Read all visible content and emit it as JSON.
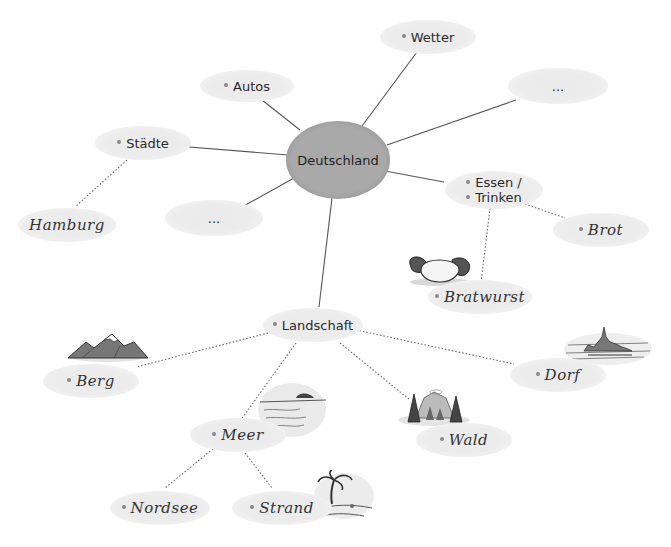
{
  "diagram": {
    "type": "mind-map",
    "center": {
      "label": "Deutschland",
      "color": "#a9a9a9"
    },
    "node_color": "#ececec",
    "nodes": {
      "wetter": {
        "label": "Wetter"
      },
      "autos": {
        "label": "Autos"
      },
      "blank_right": {
        "label": "..."
      },
      "staedte": {
        "label": "Städte"
      },
      "hamburg": {
        "label": "Hamburg"
      },
      "blank_left": {
        "label": "..."
      },
      "essen": {
        "line1": "Essen /",
        "line2": "Trinken"
      },
      "brot": {
        "label": "Brot"
      },
      "bratwurst": {
        "label": "Bratwurst"
      },
      "landschaft": {
        "label": "Landschaft"
      },
      "berg": {
        "label": "Berg"
      },
      "dorf": {
        "label": "Dorf"
      },
      "wald": {
        "label": "Wald"
      },
      "meer": {
        "label": "Meer"
      },
      "nordsee": {
        "label": "Nordsee"
      },
      "strand": {
        "label": "Strand"
      }
    },
    "illustrations": [
      "bratwurst-icon",
      "mountain-icon",
      "village-icon",
      "forest-icon",
      "sea-icon",
      "beach-palm-icon"
    ],
    "edges": {
      "solid": [
        [
          "Deutschland",
          "Wetter"
        ],
        [
          "Deutschland",
          "Autos"
        ],
        [
          "Deutschland",
          "..."
        ],
        [
          "Deutschland",
          "Städte"
        ],
        [
          "Deutschland",
          "..."
        ],
        [
          "Deutschland",
          "Essen / Trinken"
        ],
        [
          "Deutschland",
          "Landschaft"
        ]
      ],
      "dotted": [
        [
          "Städte",
          "Hamburg"
        ],
        [
          "Essen / Trinken",
          "Brot"
        ],
        [
          "Essen / Trinken",
          "Bratwurst"
        ],
        [
          "Landschaft",
          "Berg"
        ],
        [
          "Landschaft",
          "Dorf"
        ],
        [
          "Landschaft",
          "Wald"
        ],
        [
          "Landschaft",
          "Meer"
        ],
        [
          "Meer",
          "Nordsee"
        ],
        [
          "Meer",
          "Strand"
        ]
      ]
    }
  }
}
